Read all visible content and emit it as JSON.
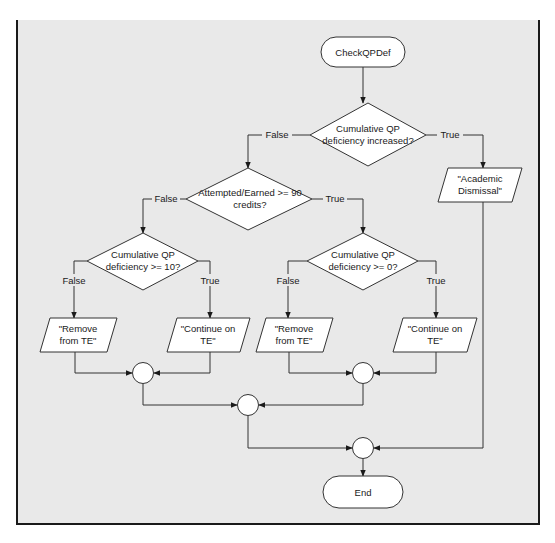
{
  "diagram": {
    "type": "flowchart",
    "start": {
      "label": "CheckQPDef"
    },
    "end": {
      "label": "End"
    },
    "decisions": [
      {
        "id": "d1",
        "line1": "Cumulative QP",
        "line2": "deficiency increased?"
      },
      {
        "id": "d2",
        "line1": "Attempted/Earned >= 90",
        "line2": "credits?"
      },
      {
        "id": "d3",
        "line1": "Cumulative QP",
        "line2": "deficiency >= 10?"
      },
      {
        "id": "d4",
        "line1": "Cumulative QP",
        "line2": "deficiency >= 0?"
      }
    ],
    "outputs": [
      {
        "id": "o1",
        "line1": "\"Academic",
        "line2": "Dismissal\""
      },
      {
        "id": "o2",
        "line1": "\"Remove",
        "line2": "from TE\""
      },
      {
        "id": "o3",
        "line1": "\"Continue on",
        "line2": "TE\""
      },
      {
        "id": "o4",
        "line1": "\"Remove",
        "line2": "from TE\""
      },
      {
        "id": "o5",
        "line1": "\"Continue on",
        "line2": "TE\""
      }
    ],
    "edge_labels": {
      "d1_false": "False",
      "d1_true": "True",
      "d2_false": "False",
      "d2_true": "True",
      "d3_false": "False",
      "d3_true": "True",
      "d4_false": "False",
      "d4_true": "True"
    },
    "colors": {
      "background": "#e9e9e9",
      "shape_fill": "#ffffff",
      "stroke": "#333333",
      "frame_border": "#1a1a1a"
    }
  }
}
